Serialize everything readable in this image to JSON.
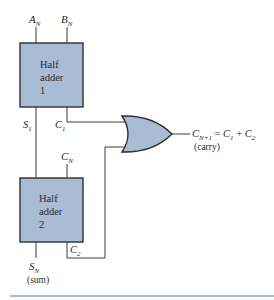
{
  "colors": {
    "block_fill": "#a9bcd4",
    "outline": "#2f2f2f",
    "wire": "#3a3a3a",
    "rule": "#8fa5bd"
  },
  "inputs": {
    "a": {
      "main": "A",
      "sub": "N"
    },
    "b": {
      "main": "B",
      "sub": "N"
    },
    "cin": {
      "main": "C",
      "sub": "N"
    }
  },
  "half_adder_1": {
    "line1": "Half",
    "line2": "adder",
    "line3": "1"
  },
  "half_adder_2": {
    "line1": "Half",
    "line2": "adder",
    "line3": "2"
  },
  "signals": {
    "s1": {
      "main": "S",
      "sub": "1"
    },
    "c1": {
      "main": "C",
      "sub": "1"
    },
    "c2": {
      "main": "C",
      "sub": "2"
    }
  },
  "outputs": {
    "carry": {
      "lhs_main": "C",
      "lhs_sub": "N+1",
      "eq": " = ",
      "t1_main": "C",
      "t1_sub": "1",
      "plus": " + ",
      "t2_main": "C",
      "t2_sub": "2",
      "note": "(carry)"
    },
    "sum": {
      "main": "S",
      "sub": "N",
      "note": "(sum)"
    }
  },
  "gate": {
    "type": "OR"
  }
}
